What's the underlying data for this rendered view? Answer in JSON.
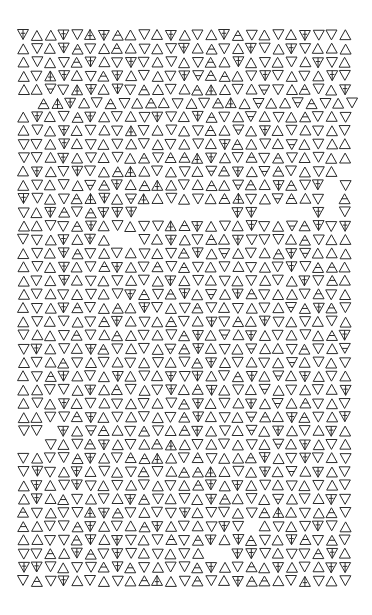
{
  "artwork": {
    "title": "Triangle glyph field",
    "ink_color": "#2a2a2a",
    "paper_color": "#ffffff",
    "grid": {
      "origin_x": 18,
      "origin_y": 30,
      "col_pitch": 13.4,
      "row_pitch": 13.65,
      "glyph_size": 11,
      "columns": 25
    },
    "legend": {
      "A": "up-triangle",
      "V": "down-triangle",
      "a": "up-triangle-with-bar",
      "v": "down-triangle-with-bar",
      "T": "up-triangle-with-stem",
      "Y": "down-triangle-with-stem",
      ".": "blank"
    },
    "rows": [
      "YAAYVTYaAVAYAVAYaVAVAYVVA",
      "AVAYaVAaAVAVYAaVAYVAYVAAA",
      "AVAVaYAVYVAVAVaAYAVAVAYVA",
      "AVTYAVaYAVAVYvaaAVYVAVAYV",
      "AAvVTYAYVaAVAaTAVAvVAaVAY",
      ".aTYAVaVAaAVAVaTAvAAvaVAV",
      "AYAVaYAVAVYVAYaVAvAVAaVAV",
      "AVAYAVAVTVAVAVaAvAYAVAVAV",
      "VVAYAVAVAVAVAVAYaAVAvAVAA",
      "VVAYAVAVAaVaaTYAVaVaVAVAA",
      "AYAVYVAaTAVAVAvaYAvaVAVA.",
      "AVAVAvaYAaTAVAaAvaAYaVY.V",
      "YVAVaTYAvTAVAVAaTVAvaAV.a",
      "VAYaVaYYY.......YY....Y.V",
      "AAVVaYAVAVVTaYAVAYVAvaYVY",
      "VVAYAYA..VAYAVaAYVVVAaVAA",
      "AVAYaVAVAVAVaYAvAVAaYvAAA",
      "AVAYAVaYAVaVaVAVAVAVYVaaA",
      "AVAYAVAVAVAYAVAVAVAVAYVaA",
      "AVAVAVAVYaVaYAvAYaVAAVaVA",
      "AVAYaVAaAYVAVaVAVAVAvaYaV",
      "AVAVAVaYAVAaVAYVaAYVAVAVA",
      "VAAVaVAaAVAVaYAvAYAVAVAaY",
      "VYAVAYaVAVAvaYAVAvAAVaVAv",
      "AVAaVAVAVAVAVaYAVAVAvAVAV",
      "AVaYAVAYAVAYVYAVaYAvAYAVA",
      "AAVVAYAaVAVYAaYAVAvAVAVAY",
      "AVAYAVAVAVAVaYAVAYAvAaVAV",
      "AAVVaYAVAVAVaYAVAvaAYaVAY",
      "VV.YAvaAVaVAaYAVAvAYAVAYA",
      "..VAVaYAVAaTAVAVAVAvAYAVA",
      "VAVVaYAVaaTAVaVAAaYAVYVAV",
      "VYVAYAVAVaVAaaTAVAYAvAYAV",
      "AYAVYVAVAVAVAaYAYAVAVAVAV",
      "AYAaVAVAYaVAVAYaAVAvAVAYV",
      "aVAVVTYaVAVVYAVVAVaTAVAaV",
      "aAVVaYAVAaYAVAVYV.AVAVYVA",
      "AAVVaYAYVAVaVaYAYaVAYaVaV",
      "VVaAYaVYVAVAVA..YYVAVVaYA",
      "YYVAVVaYaVAVVaYAVaAYAVAYY",
      "VaVYAVAVAaTAVaVAYaaAVTVAV"
    ],
    "row_offsets": [
      0,
      0,
      0,
      0,
      0,
      1,
      0,
      0,
      0,
      0,
      0,
      0,
      0,
      0,
      0,
      0,
      0,
      0,
      0,
      0,
      0,
      0,
      0,
      0,
      0,
      0,
      0,
      0,
      0,
      0,
      0,
      0,
      0,
      0,
      0,
      0,
      0,
      0,
      0,
      0,
      0
    ]
  }
}
